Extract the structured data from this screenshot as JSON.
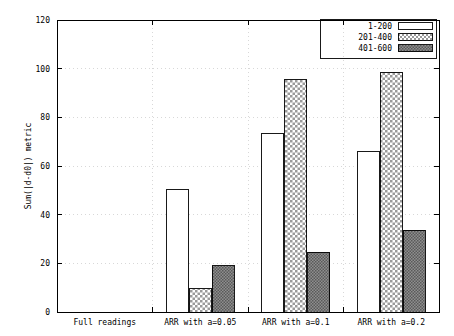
{
  "chart_data": {
    "type": "bar",
    "title": "",
    "subtitle": "",
    "xlabel": "",
    "ylabel": "Sum(|d-d0|) metric",
    "ylim": [
      0,
      120
    ],
    "yticks": [
      0,
      20,
      40,
      60,
      80,
      100,
      120
    ],
    "ytick_labels": [
      "0",
      "20",
      "40",
      "60",
      "80",
      "100",
      "120"
    ],
    "grid": true,
    "legend_position": "top-right",
    "categories": [
      "Full readings",
      "ARR with a=0.05",
      "ARR with a=0.1",
      "ARR with a=0.2"
    ],
    "series": [
      {
        "name": "1-200",
        "values": [
          0,
          50.5,
          73.5,
          66.0
        ]
      },
      {
        "name": "201-400",
        "values": [
          0,
          9.5,
          95.5,
          98.5
        ]
      },
      {
        "name": "401-600",
        "values": [
          0,
          19.0,
          24.5,
          33.5
        ]
      }
    ]
  },
  "legend": {
    "entries": [
      {
        "label": "1-200",
        "pattern": "solid-white"
      },
      {
        "label": "201-400",
        "pattern": "checkerboard"
      },
      {
        "label": "401-600",
        "pattern": "dense-stipple"
      }
    ]
  },
  "axes": {
    "y_title": "Sum(|d-d0|) metric",
    "y_tick_labels": [
      "0",
      "20",
      "40",
      "60",
      "80",
      "100",
      "120"
    ],
    "x_tick_labels": [
      "Full readings",
      "ARR with a=0.05",
      "ARR with a=0.1",
      "ARR with a=0.2"
    ]
  },
  "colors": {
    "axis": "#000000",
    "grid": "#c8c8c8",
    "series_1_fill": "#ffffff",
    "series_2_fill": "#e8e8e8",
    "series_3_fill": "#8a8a8a",
    "background": "#ffffff"
  }
}
